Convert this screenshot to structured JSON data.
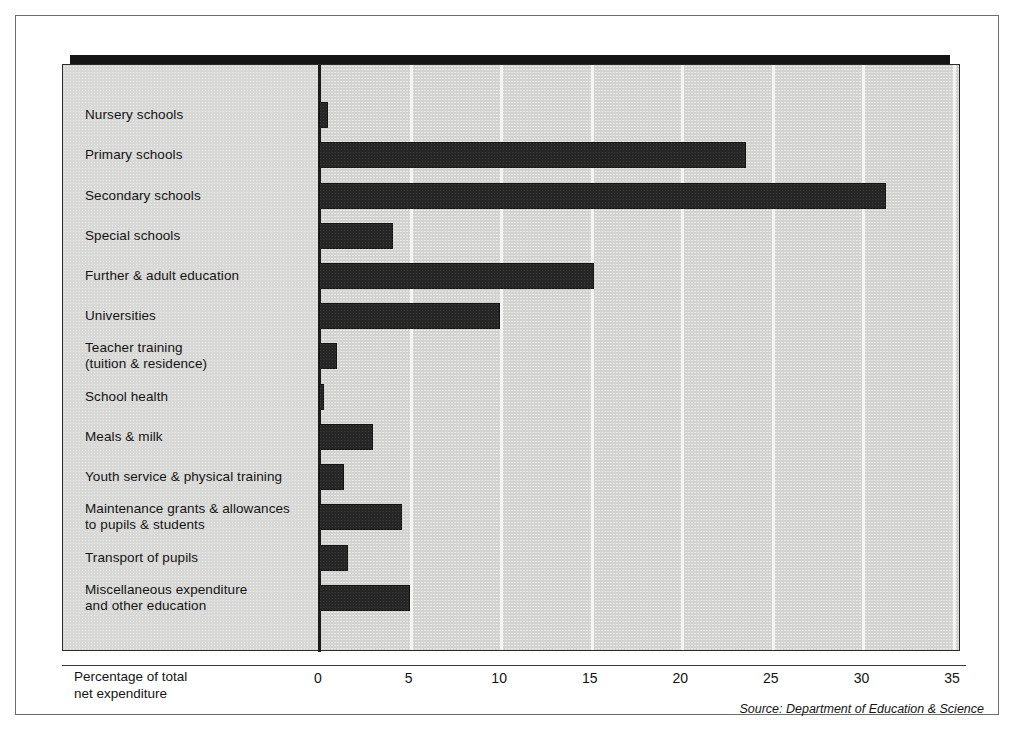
{
  "chart_data": {
    "type": "bar",
    "orientation": "horizontal",
    "title": "",
    "xlabel": "Percentage of total net expenditure",
    "ylabel": "",
    "xlim": [
      0,
      35
    ],
    "xticks": [
      0,
      5,
      10,
      15,
      20,
      25,
      30,
      35
    ],
    "xtick_labels": [
      "0",
      "5",
      "10",
      "15",
      "20",
      "25",
      "30",
      "35"
    ],
    "grid": "vertical white gridlines at each tick",
    "legend": "none",
    "source": "Source: Department of Education & Science",
    "categories": [
      "Nursery schools",
      "Primary schools",
      "Secondary schools",
      "Special schools",
      "Further & adult education",
      "Universities",
      "Teacher training\n(tuition & residence)",
      "School health",
      "Meals & milk",
      "Youth service & physical training",
      "Maintenance grants & allowances\nto pupils & students",
      "Transport of pupils",
      "Miscellaneous expenditure\nand other education"
    ],
    "values": [
      0.5,
      23.6,
      31.3,
      4.1,
      15.2,
      10.0,
      1.0,
      0.3,
      3.0,
      1.4,
      4.6,
      1.6,
      5.0
    ],
    "colors": {
      "bar": "#262626",
      "plot_background": "#d2d2d0",
      "label_background": "#d8d8d6",
      "gridline": "#f4f4f2",
      "axis": "#1c1c1c",
      "panel_shadow": "#151515",
      "page_background": "#ffffff",
      "text": "#141414"
    }
  },
  "axis": {
    "caption_line1": "Percentage of total",
    "caption_line2": "net expenditure"
  },
  "footer": {
    "source": "Source: Department of Education & Science"
  }
}
